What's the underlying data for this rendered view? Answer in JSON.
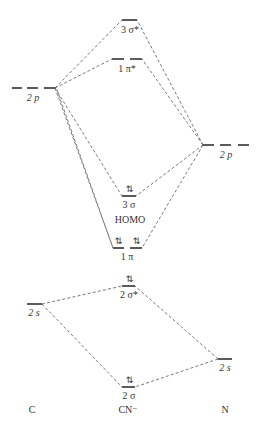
{
  "columns": {
    "left": "C",
    "center": "CN⁻",
    "right": "N"
  },
  "atomic_orbitals": {
    "c_2p": {
      "label": "2 p",
      "y": 88
    },
    "c_2s": {
      "label": "2 s",
      "y": 304
    },
    "n_2p": {
      "label": "2 p",
      "y": 145
    },
    "n_2s": {
      "label": "2 s",
      "y": 359
    }
  },
  "molecular_orbitals": {
    "sigma3_star": {
      "label": "3 σ*",
      "electrons": "",
      "y": 20
    },
    "pi1_star": {
      "label": "1 π*",
      "electrons": "",
      "y": 59
    },
    "sigma3": {
      "label": "3 σ",
      "electrons": "⇅",
      "y": 196,
      "note": "HOMO"
    },
    "pi1": {
      "label": "1 π",
      "electrons": [
        "⇅",
        "⇅"
      ],
      "y": 248
    },
    "sigma2_star": {
      "label": "2 σ*",
      "electrons": "⇅",
      "y": 286
    },
    "sigma2": {
      "label": "2 σ",
      "electrons": "⇅",
      "y": 387
    }
  },
  "homo_label": "HOMO",
  "colors": {
    "line": "#333333",
    "connector": "#555555",
    "background": "#ffffff"
  }
}
